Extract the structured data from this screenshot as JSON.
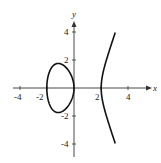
{
  "chart_data": {
    "type": "line",
    "title": "",
    "equation": "y^2 = x^3 - 4x",
    "xlabel": "x",
    "ylabel": "y",
    "xlim": [
      -4.5,
      5
    ],
    "ylim": [
      -5,
      5
    ],
    "grid": false,
    "legend": null,
    "x_ticks": [
      -4,
      -2,
      2,
      4
    ],
    "y_ticks": [
      -4,
      -2,
      2,
      4
    ],
    "x_tick_labels": [
      "-4",
      "-2",
      "2",
      "4"
    ],
    "y_tick_labels": [
      "-4",
      "-2",
      "2",
      "4"
    ],
    "series": [
      {
        "name": "oval",
        "description": "closed loop from x=-2 to x=0, max |y| ≈ 1.75 at x ≈ -1.15"
      },
      {
        "name": "right-branch",
        "description": "open branch starting at x=2, extends to y=±4 at x≈3.0"
      }
    ]
  },
  "axes": {
    "x_label": "x",
    "y_label": "y"
  },
  "ticks": {
    "x": [
      {
        "v": -4,
        "label": "-4"
      },
      {
        "v": -2,
        "label": "-2"
      },
      {
        "v": 2,
        "label": "2"
      },
      {
        "v": 4,
        "label": "4"
      }
    ],
    "y": [
      {
        "v": 4,
        "label": "4"
      },
      {
        "v": 2,
        "label": "2"
      },
      {
        "v": -2,
        "label": "-2"
      },
      {
        "v": -4,
        "label": "-4"
      }
    ]
  }
}
